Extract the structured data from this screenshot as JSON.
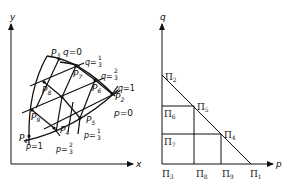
{
  "left_panel": {
    "axes": {
      "x_label": "x",
      "y_label": "y"
    },
    "nodes": [
      {
        "id": "P1",
        "name": "P",
        "sub": "1"
      },
      {
        "id": "P2",
        "name": "P",
        "sub": "2"
      },
      {
        "id": "P3",
        "name": "P",
        "sub": "3"
      },
      {
        "id": "P4",
        "name": "P",
        "sub": "4"
      },
      {
        "id": "P5",
        "name": "P",
        "sub": "5"
      },
      {
        "id": "P6",
        "name": "P",
        "sub": "6"
      },
      {
        "id": "P7",
        "name": "P",
        "sub": "7"
      },
      {
        "id": "P8",
        "name": "P",
        "sub": "8"
      },
      {
        "id": "P9",
        "name": "P",
        "sub": "9"
      }
    ],
    "q_labels": {
      "q0": {
        "var": "q",
        "eq": "=",
        "val": "0"
      },
      "q13": {
        "var": "q",
        "eq": "=",
        "num": "1",
        "den": "3"
      },
      "q23": {
        "var": "q",
        "eq": "=",
        "num": "2",
        "den": "3"
      },
      "q1": {
        "var": "q",
        "eq": "=",
        "val": "1"
      }
    },
    "p_labels": {
      "p0": {
        "var": "p",
        "eq": "=",
        "val": "0"
      },
      "p13": {
        "var": "p",
        "eq": "=",
        "num": "1",
        "den": "3"
      },
      "p23": {
        "var": "p",
        "eq": "=",
        "num": "2",
        "den": "3"
      },
      "p1": {
        "var": "p",
        "eq": "=",
        "val": "1"
      }
    }
  },
  "right_panel": {
    "axes": {
      "x_label": "p",
      "y_label": "q"
    },
    "nodes": [
      {
        "id": "Pi1",
        "name": "Π",
        "sub": "1"
      },
      {
        "id": "Pi2",
        "name": "Π",
        "sub": "2"
      },
      {
        "id": "Pi3",
        "name": "Π",
        "sub": "3"
      },
      {
        "id": "Pi4",
        "name": "Π",
        "sub": "4"
      },
      {
        "id": "Pi5",
        "name": "Π",
        "sub": "5"
      },
      {
        "id": "Pi6",
        "name": "Π",
        "sub": "6"
      },
      {
        "id": "Pi7",
        "name": "Π",
        "sub": "7"
      },
      {
        "id": "Pi8",
        "name": "Π",
        "sub": "8"
      },
      {
        "id": "Pi9",
        "name": "Π",
        "sub": "9"
      }
    ]
  },
  "colors": {
    "line": "#111111",
    "background": "#ffffff"
  }
}
